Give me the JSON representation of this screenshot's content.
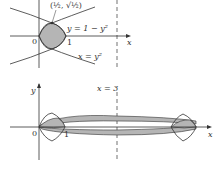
{
  "figure": {
    "top": {
      "point_label": "(½, √½)",
      "curve1_label": "y = 1 − y²",
      "curve2_label": "x = y²",
      "origin_label": "0",
      "one_label": "1",
      "x_axis_label": "x",
      "line_label": "x = 3"
    },
    "bottom": {
      "y_axis_label": "y",
      "line_label": "x = 3",
      "origin_label": "0",
      "one_label": "1",
      "x_axis_label": "x"
    },
    "colors": {
      "region_fill": "#b5b5b5",
      "line": "#333333"
    }
  }
}
